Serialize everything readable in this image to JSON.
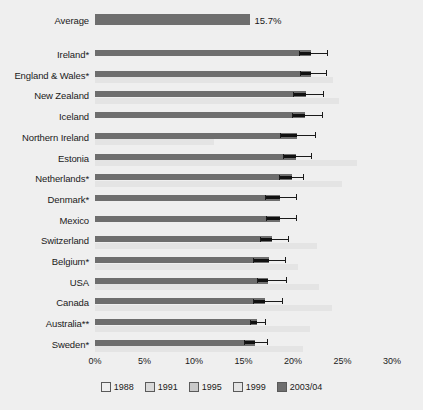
{
  "chart_data": {
    "type": "bar",
    "orientation": "horizontal",
    "title": "",
    "xlabel": "",
    "ylabel": "",
    "xlim": [
      0,
      30
    ],
    "xticks": [
      "0%",
      "5%",
      "10%",
      "15%",
      "20%",
      "25%",
      "30%"
    ],
    "xtick_values": [
      0,
      5,
      10,
      15,
      20,
      25,
      30
    ],
    "grid": false,
    "legend_position": "bottom",
    "series_names": [
      "1988",
      "1991",
      "1995",
      "1999",
      "2003/04"
    ],
    "series_colors": [
      "#efefef",
      "#d9d9d9",
      "#c9c9c9",
      "#e4e4e4",
      "#6e6e6e"
    ],
    "average": {
      "label": "Average",
      "value": 15.7,
      "value_label": "15.7%"
    },
    "categories": [
      "Ireland*",
      "England & Wales*",
      "New Zealand",
      "Iceland",
      "Northern Ireland",
      "Estonia",
      "Netherlands*",
      "Denmark*",
      "Mexico",
      "Switzerland",
      "Belgium*",
      "USA",
      "Canada",
      "Australia**",
      "Sweden*"
    ],
    "rows": [
      {
        "category": "Ireland*",
        "y2003": 21.8,
        "err_low": 20.6,
        "err_high": 23.4,
        "y1999": null,
        "y1995": null,
        "y1991": null,
        "y1988": null
      },
      {
        "category": "England & Wales*",
        "y2003": 21.8,
        "err_low": 20.7,
        "err_high": 23.3,
        "y1999": 24.0,
        "y1995": null,
        "y1991": null,
        "y1988": null
      },
      {
        "category": "New Zealand",
        "y2003": 21.3,
        "err_low": 20.0,
        "err_high": 23.0,
        "y1999": 24.6,
        "y1995": null,
        "y1991": null,
        "y1988": null
      },
      {
        "category": "Iceland",
        "y2003": 21.2,
        "err_low": 19.9,
        "err_high": 22.9,
        "y1999": null,
        "y1995": null,
        "y1991": null,
        "y1988": null
      },
      {
        "category": "Northern Ireland",
        "y2003": 20.4,
        "err_low": 18.7,
        "err_high": 22.2,
        "y1999": 12.0,
        "y1995": null,
        "y1991": null,
        "y1988": null
      },
      {
        "category": "Estonia",
        "y2003": 20.3,
        "err_low": 19.0,
        "err_high": 21.8,
        "y1999": 26.5,
        "y1995": null,
        "y1991": null,
        "y1988": null
      },
      {
        "category": "Netherlands*",
        "y2003": 19.9,
        "err_low": 18.6,
        "err_high": 21.0,
        "y1999": 24.9,
        "y1995": null,
        "y1991": null,
        "y1988": null
      },
      {
        "category": "Denmark*",
        "y2003": 18.7,
        "err_low": 17.2,
        "err_high": 20.3,
        "y1999": null,
        "y1995": null,
        "y1991": null,
        "y1988": null
      },
      {
        "category": "Mexico",
        "y2003": 18.7,
        "err_low": 17.3,
        "err_high": 20.3,
        "y1999": null,
        "y1995": null,
        "y1991": null,
        "y1988": null
      },
      {
        "category": "Switzerland",
        "y2003": 17.9,
        "err_low": 16.7,
        "err_high": 19.5,
        "y1999": 22.4,
        "y1995": null,
        "y1991": null,
        "y1988": null
      },
      {
        "category": "Belgium*",
        "y2003": 17.6,
        "err_low": 16.0,
        "err_high": 19.2,
        "y1999": 20.5,
        "y1995": null,
        "y1991": null,
        "y1988": null
      },
      {
        "category": "USA",
        "y2003": 17.5,
        "err_low": 16.4,
        "err_high": 19.3,
        "y1999": 22.6,
        "y1995": null,
        "y1991": null,
        "y1988": null
      },
      {
        "category": "Canada",
        "y2003": 17.2,
        "err_low": 16.0,
        "err_high": 18.9,
        "y1999": 23.9,
        "y1995": null,
        "y1991": null,
        "y1988": null
      },
      {
        "category": "Australia**",
        "y2003": 16.4,
        "err_low": 15.7,
        "err_high": 17.2,
        "y1999": 21.7,
        "y1995": null,
        "y1991": null,
        "y1988": null
      },
      {
        "category": "Sweden*",
        "y2003": 16.2,
        "err_low": 15.0,
        "err_high": 17.4,
        "y1999": 21.0,
        "y1995": null,
        "y1991": null,
        "y1988": null
      }
    ],
    "legend": [
      {
        "label": "1988",
        "color": "#efefef"
      },
      {
        "label": "1991",
        "color": "#d9d9d9"
      },
      {
        "label": "1995",
        "color": "#c9c9c9"
      },
      {
        "label": "1999",
        "color": "#e4e4e4"
      },
      {
        "label": "2003/04",
        "color": "#6e6e6e"
      }
    ]
  }
}
